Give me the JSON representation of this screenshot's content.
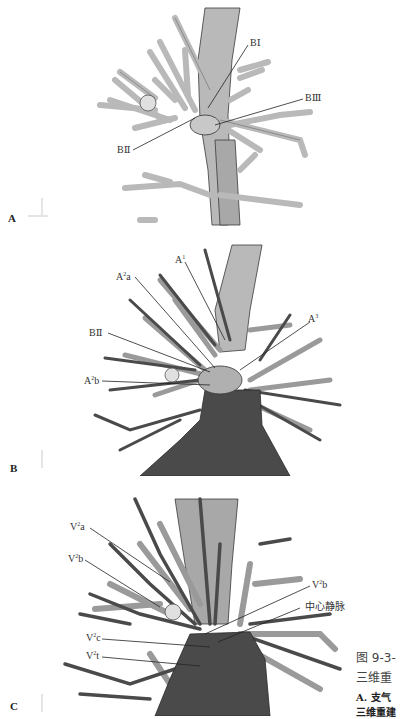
{
  "figure": {
    "panels": [
      {
        "id": "A",
        "letter": "A",
        "labels": [
          {
            "text": "BⅠ",
            "name": "label-b1"
          },
          {
            "text": "BⅢ",
            "name": "label-b3"
          },
          {
            "text": "BⅡ",
            "name": "label-b2"
          }
        ]
      },
      {
        "id": "B",
        "letter": "B",
        "labels": [
          {
            "base": "A",
            "sup": "1",
            "suffix": "",
            "name": "label-a1"
          },
          {
            "base": "A",
            "sup": "2",
            "suffix": "a",
            "name": "label-a2a"
          },
          {
            "base": "A",
            "sup": "3",
            "suffix": "",
            "name": "label-a3"
          },
          {
            "base": "BⅡ",
            "sup": "",
            "suffix": "",
            "name": "label-b2"
          },
          {
            "base": "A",
            "sup": "2",
            "suffix": "b",
            "name": "label-a2b"
          }
        ]
      },
      {
        "id": "C",
        "letter": "C",
        "labels": [
          {
            "base": "V",
            "sup": "2",
            "suffix": "a",
            "name": "label-v2a"
          },
          {
            "base": "V",
            "sup": "2",
            "suffix": "b",
            "name": "label-v2b-left"
          },
          {
            "base": "V",
            "sup": "2",
            "suffix": "b",
            "name": "label-v2b-right"
          },
          {
            "base": "中心静脉",
            "sup": "",
            "suffix": "",
            "name": "label-central-vein"
          },
          {
            "base": "V",
            "sup": "2",
            "suffix": "c",
            "name": "label-v2c"
          },
          {
            "base": "V",
            "sup": "2",
            "suffix": "t",
            "name": "label-v2t"
          }
        ]
      }
    ],
    "caption": {
      "line1": "图 9-3-",
      "line2": "三维重",
      "line3": "A. 支气",
      "line4": "三维重建"
    },
    "colors": {
      "bronchus": "#b9b9b9",
      "artery": "#9a9a9a",
      "vein": "#4a4a4a",
      "outline": "#3a3a3a",
      "nodule": "#e0e0e0"
    }
  }
}
